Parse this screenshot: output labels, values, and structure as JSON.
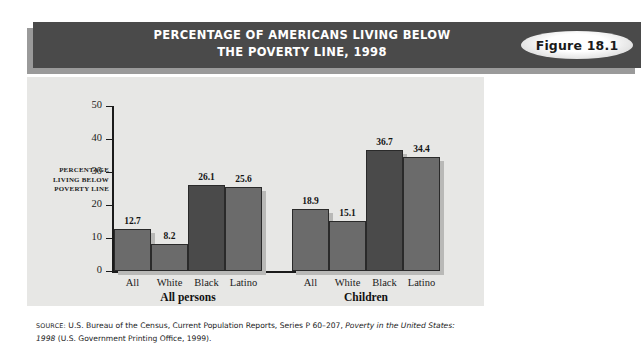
{
  "header": {
    "title_line1": "PERCENTAGE OF AMERICANS LIVING BELOW",
    "title_line2": "THE POVERTY LINE, 1998",
    "figure_badge": "Figure 18.1"
  },
  "axis": {
    "y_label_line1": "PERCENTAGE",
    "y_label_line2": "LIVING BELOW",
    "y_label_line3": "POVERTY LINE",
    "y_ticks": [
      "0",
      "10",
      "20",
      "30",
      "40",
      "50"
    ]
  },
  "source": {
    "prefix": "SOURCE:",
    "text_part1": " U.S. Bureau of the Census, Current Population Reports, Series P 60–207, ",
    "italic1": "Poverty in the United States: 1998",
    "text_part2": " (U.S. Government Printing Office, 1999)."
  },
  "colors": {
    "banner": "#4a4a4a",
    "panel": "#e7e7e5",
    "bar_light": "#6b6b6b",
    "bar_dark": "#4a4a4a"
  },
  "chart_data": {
    "type": "bar",
    "title": "PERCENTAGE OF AMERICANS LIVING BELOW THE POVERTY LINE, 1998",
    "xlabel": "",
    "ylabel": "PERCENTAGE LIVING BELOW POVERTY LINE",
    "ylim": [
      0,
      50
    ],
    "ytick_step": 10,
    "grid": false,
    "legend": "none",
    "groups": [
      {
        "name": "All persons",
        "categories": [
          "All",
          "White",
          "Black",
          "Latino"
        ],
        "values": [
          12.7,
          8.2,
          26.1,
          25.6
        ],
        "shades": [
          "light",
          "light",
          "dark",
          "light"
        ]
      },
      {
        "name": "Children",
        "categories": [
          "All",
          "White",
          "Black",
          "Latino"
        ],
        "values": [
          18.9,
          15.1,
          36.7,
          34.4
        ],
        "shades": [
          "light",
          "light",
          "dark",
          "light"
        ]
      }
    ]
  }
}
